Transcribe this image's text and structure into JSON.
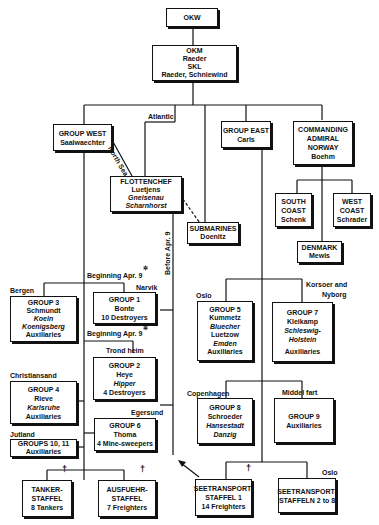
{
  "nodes": {
    "okw": {
      "lines": [
        "OKW"
      ]
    },
    "okm": {
      "lines": [
        "OKM",
        "Raeder",
        "SKL",
        "Raeder, Schniewind"
      ]
    },
    "group_west": {
      "lines": [
        "GROUP WEST",
        "Saalwaechter"
      ]
    },
    "group_east": {
      "lines": [
        "GROUP EAST",
        "Carls"
      ]
    },
    "adm_norway": {
      "lines": [
        "COMMANDING",
        "ADMIRAL",
        "NORWAY",
        "Boehm"
      ]
    },
    "flottenchef": {
      "lines": [
        "FLOTTENCHEF",
        "Luetjens",
        "Gneisenau",
        "Scharnhorst"
      ]
    },
    "submarines": {
      "lines": [
        "SUBMARINES",
        "Doenitz"
      ]
    },
    "south_coast": {
      "lines": [
        "SOUTH",
        "COAST",
        "Schenk"
      ]
    },
    "west_coast": {
      "lines": [
        "WEST",
        "COAST",
        "Schrader"
      ]
    },
    "denmark": {
      "lines": [
        "DENMARK",
        "Mewis"
      ]
    },
    "group3": {
      "lines": [
        "GROUP 3",
        "Schmundt",
        "Koeln",
        "Koenigsberg",
        "Auxiliaries"
      ]
    },
    "group1": {
      "lines": [
        "GROUP 1",
        "Bonte",
        "10 Destroyers"
      ]
    },
    "group2": {
      "lines": [
        "GROUP 2",
        "Heye",
        "Hipper",
        "4 Destroyers"
      ]
    },
    "group4": {
      "lines": [
        "GROUP 4",
        "Rieve",
        "Karlsruhe",
        "Auxiliaries"
      ]
    },
    "group6": {
      "lines": [
        "GROUP 6",
        "Thoma",
        "4 Mine-sweepers"
      ]
    },
    "groups10_11": {
      "lines": [
        "GROUPS 10, 11",
        "Auxiliaries"
      ]
    },
    "group5": {
      "lines": [
        "GROUP 5",
        "Kummetz",
        "Bluecher",
        "Luetzow",
        "Emden",
        "Auxiliaries"
      ]
    },
    "group7": {
      "lines": [
        "GROUP 7",
        "Kleikamp",
        "Schleswig-",
        "Holstein",
        "Auxiliaries"
      ]
    },
    "group8": {
      "lines": [
        "GROUP 8",
        "Schroeder",
        "Hansestadt",
        "Danzig"
      ]
    },
    "group9": {
      "lines": [
        "GROUP 9",
        "Auxiliaries"
      ]
    },
    "tanker": {
      "lines": [
        "TANKER-",
        "STAFFEL",
        "8 Tankers"
      ]
    },
    "ausfuehr": {
      "lines": [
        "AUSFUEHR-",
        "STAFFEL",
        "7 Freighters"
      ]
    },
    "seetransport1": {
      "lines": [
        "SEETRANSPORT-",
        "STAFFEL 1",
        "14 Freighters"
      ]
    },
    "seetransport2_8": {
      "lines": [
        "SEETRANSPORT-",
        "STAFFELN 2 to 8"
      ]
    }
  },
  "labels": {
    "atlantic": "Atlantic",
    "north_sea": "North Sea",
    "before_apr9": "Before Apr. 9",
    "beginning_apr9_a": "Beginning Apr. 9",
    "beginning_apr9_b": "Beginning Apr. 9",
    "bergen": "Bergen",
    "narvik": "Narvik",
    "trondheim": "Trond heim",
    "christiansand": "Christiansand",
    "egersund": "Egersund",
    "jutland": "Jutland",
    "oslo_g5": "Oslo",
    "korsoer": "Korsoer and",
    "nyborg": "Nyborg",
    "copenhagen": "Copenhagen",
    "middelfart": "Middel fart",
    "oslo_st": "Oslo",
    "dagger": "†",
    "star": "✲"
  }
}
